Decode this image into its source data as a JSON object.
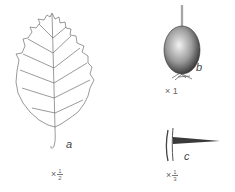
{
  "figures": {
    "leaf": {
      "label": "a",
      "scale_prefix": "×",
      "scale_num": "1",
      "scale_den": "2"
    },
    "fruit": {
      "label": "b",
      "scale": "× 1"
    },
    "thorn": {
      "label": "c",
      "scale_prefix": "×",
      "scale_num": "1",
      "scale_den": "3"
    }
  },
  "colors": {
    "line": "#6e6e6e",
    "fruit_dark": "#3a3a3a",
    "fruit_light": "#e6e6e6"
  }
}
